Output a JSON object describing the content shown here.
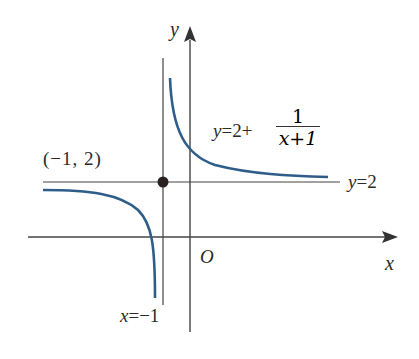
{
  "figure": {
    "axes": {
      "x_label": "x",
      "y_label": "y",
      "origin_label": "O"
    },
    "function_label": {
      "lhs": "y",
      "eq": "=2+",
      "numerator": "1",
      "denominator": "x+1",
      "full": "y=2+1/(x+1)"
    },
    "horizontal_asymptote_label": "y=2",
    "vertical_asymptote_label": "x=−1",
    "center_point_label": "(−1, 2)",
    "colors": {
      "curve": "#2f5d8a",
      "axes": "#333333",
      "point": "#2b2220"
    }
  }
}
